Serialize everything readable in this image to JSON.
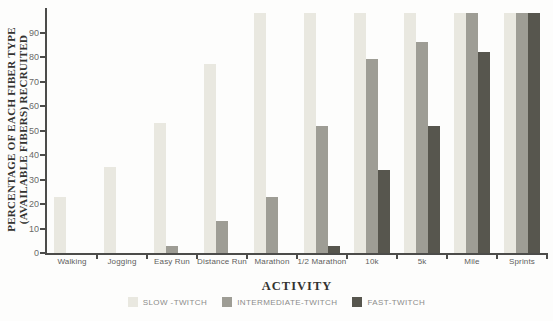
{
  "chart_data": {
    "type": "bar",
    "title": "",
    "xlabel": "ACTIVITY",
    "ylabel": [
      "PERCENTAGE OF EACH FIBER TYPE",
      "(AVAILABLE FIBERS) RECRUITED"
    ],
    "categories": [
      "Walking",
      "Jogging",
      "Easy Run",
      "Distance Run",
      "Marathon",
      "1/2 Marathon",
      "10k",
      "5k",
      "Mile",
      "Sprints"
    ],
    "series": [
      {
        "name": "SLOW -TWITCH",
        "color": "#e9e8e0",
        "values": [
          23,
          35,
          53,
          77,
          98,
          98,
          98,
          98,
          98,
          98
        ]
      },
      {
        "name": "INTERMEDIATE-TWITCH",
        "color": "#9e9d95",
        "values": [
          0,
          0,
          3,
          13,
          23,
          52,
          79,
          86,
          98,
          98
        ]
      },
      {
        "name": "FAST-TWITCH",
        "color": "#57564e",
        "values": [
          0,
          0,
          0,
          0,
          0,
          3,
          34,
          52,
          82,
          98
        ]
      }
    ],
    "ylim": [
      0,
      100
    ],
    "yticks": [
      0,
      10,
      20,
      30,
      40,
      50,
      60,
      70,
      80,
      90
    ],
    "grid": false,
    "legend_position": "bottom",
    "axis_color": "#4c4c4a"
  }
}
